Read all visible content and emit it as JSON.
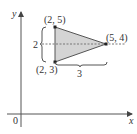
{
  "diagram": {
    "type": "coordinate-geometry",
    "axes": {
      "x_label": "x",
      "y_label": "y",
      "origin_label": "0"
    },
    "triangle": {
      "fill": "#d4d4d4",
      "stroke": "#555555",
      "vertices": [
        {
          "label": "(2, 5)",
          "x": 2,
          "y": 5
        },
        {
          "label": "(2, 3)",
          "x": 2,
          "y": 3
        },
        {
          "label": "(5, 4)",
          "x": 5,
          "y": 4
        }
      ]
    },
    "dashed_line": {
      "y": 4
    },
    "height_brace": {
      "label": "2"
    },
    "width_brace": {
      "label": "3"
    }
  }
}
